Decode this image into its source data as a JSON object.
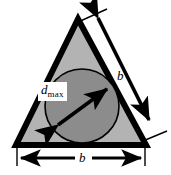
{
  "figure": {
    "shapes": {
      "triangle": {
        "name": "equilateral-triangle",
        "fill_color": "#b3b3b3",
        "stroke_color": "#000000",
        "apex": [
          78,
          19
        ],
        "base_left": [
          16,
          145
        ],
        "base_right": [
          146,
          145
        ]
      },
      "circle": {
        "name": "inscribed-circle",
        "fill_color": "#8c8c8c",
        "stroke_color": "#000000",
        "center": [
          82,
          106
        ],
        "radius": 37
      }
    },
    "labels": {
      "dmax": {
        "symbol": "d",
        "subscript": "max",
        "meaning": "maximum inscribed circle diameter"
      },
      "b_right": "b",
      "b_bottom": "b"
    },
    "dimension_arrows": [
      {
        "name": "diameter-arrow",
        "label": "d max",
        "style": "double-headed",
        "from": [
          56,
          126
        ],
        "to": [
          109,
          87
        ]
      },
      {
        "name": "right-side-arrow",
        "label": "b",
        "style": "double-headed",
        "from": [
          96,
          15
        ],
        "to": [
          151,
          123
        ]
      },
      {
        "name": "base-arrow",
        "label": "b",
        "style": "double-headed",
        "from": [
          19,
          159
        ],
        "to": [
          143,
          159
        ]
      }
    ]
  }
}
